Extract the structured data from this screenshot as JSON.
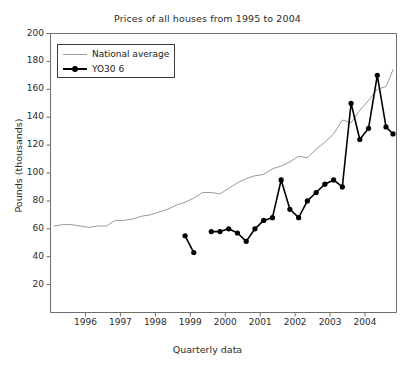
{
  "chart_data": {
    "type": "line",
    "title": "Prices of all houses from 1995 to 2004",
    "xlabel": "Quarterly data",
    "ylabel": "Pounds (thousands)",
    "ylim": [
      0,
      200
    ],
    "xlim": [
      1995.0,
      2004.9
    ],
    "grid": false,
    "legend_position": "top-left",
    "ytick_labels": [
      "20",
      "40",
      "60",
      "80",
      "100",
      "120",
      "140",
      "160",
      "180",
      "200"
    ],
    "ytick_values": [
      20,
      40,
      60,
      80,
      100,
      120,
      140,
      160,
      180,
      200
    ],
    "xtick_labels": [
      "1996",
      "1997",
      "1998",
      "1999",
      "2000",
      "2001",
      "2002",
      "2003",
      "2004"
    ],
    "xtick_values": [
      1996,
      1997,
      1998,
      1999,
      2000,
      2001,
      2002,
      2003,
      2004
    ],
    "series": [
      {
        "name": "National average",
        "color": "#9a9a9a",
        "marker": "none",
        "x": [
          1995.1,
          1995.35,
          1995.6,
          1995.85,
          1996.1,
          1996.35,
          1996.6,
          1996.85,
          1997.1,
          1997.35,
          1997.6,
          1997.85,
          1998.1,
          1998.35,
          1998.6,
          1998.85,
          1999.1,
          1999.35,
          1999.6,
          1999.85,
          2000.1,
          2000.35,
          2000.6,
          2000.85,
          2001.1,
          2001.35,
          2001.6,
          2001.85,
          2002.1,
          2002.35,
          2002.6,
          2002.85,
          2003.1,
          2003.35,
          2003.6,
          2003.85,
          2004.1,
          2004.35,
          2004.6,
          2004.8
        ],
        "values": [
          62,
          63,
          63,
          62,
          61,
          62,
          62,
          66,
          66,
          67,
          69,
          70,
          72,
          74,
          77,
          79,
          82,
          86,
          86,
          85,
          89,
          93,
          96,
          98,
          99,
          103,
          105,
          108,
          112,
          111,
          117,
          122,
          128,
          138,
          136,
          145,
          152,
          160,
          162,
          174
        ]
      },
      {
        "name": "YO30 6",
        "color": "#000000",
        "marker": "circle",
        "segments": [
          {
            "x": [
              1998.85,
              1999.1
            ],
            "values": [
              55,
              43
            ]
          },
          {
            "x": [
              1999.6,
              1999.85,
              2000.1,
              2000.35,
              2000.6,
              2000.85,
              2001.1,
              2001.35,
              2001.6,
              2001.85,
              2002.1,
              2002.35,
              2002.6,
              2002.85,
              2003.1,
              2003.35,
              2003.6,
              2003.85,
              2004.1,
              2004.35,
              2004.6,
              2004.8
            ],
            "values": [
              58,
              58,
              60,
              57,
              51,
              60,
              66,
              68,
              95,
              74,
              68,
              80,
              86,
              92,
              95,
              90,
              150,
              124,
              132,
              170,
              133,
              128,
              126,
              140
            ]
          }
        ]
      }
    ]
  },
  "legend": {
    "items": [
      {
        "label": "National average"
      },
      {
        "label": "YO30 6"
      }
    ]
  }
}
